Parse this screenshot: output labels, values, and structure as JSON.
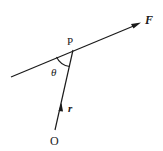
{
  "diagram": {
    "title": "",
    "labels": {
      "force": "F",
      "point_p": "P",
      "angle": "θ",
      "position_vector": "r",
      "origin": "O"
    },
    "colors": {
      "stroke": "#1a1a1a",
      "background": "#ffffff"
    },
    "geometry": {
      "line_of_action": {
        "x1": 11,
        "y1": 77,
        "x2": 140,
        "y2": 23
      },
      "position_line": {
        "x1": 55,
        "y1": 130,
        "x2": 73,
        "y2": 50
      },
      "point_p": {
        "x": 73,
        "y": 50
      },
      "origin": {
        "x": 55,
        "y": 130
      }
    }
  }
}
